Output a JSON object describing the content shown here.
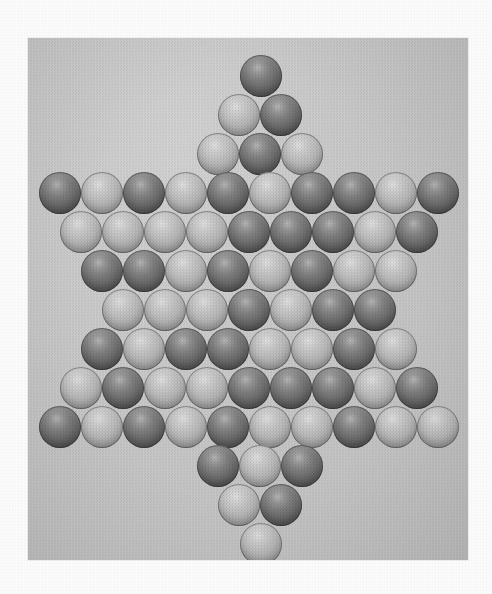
{
  "scene": {
    "title": "Chinese checkers marbles arranged in a six-pointed star",
    "paper_color": "#fbfbfb",
    "photo": {
      "x": 28,
      "y": 38,
      "width": 440,
      "height": 522,
      "background_color": "#c9c9c9",
      "description": "Black and white halftone photograph of a Chinese checkers board completely filled with marbles forming a six-pointed star"
    }
  },
  "legend": {
    "dark_label": "dark marble",
    "light_label": "light marble",
    "dark_color": "#6d6d6d",
    "light_color": "#c3c3c3"
  },
  "board": {
    "marble_diameter": 42,
    "row_pitch": 39,
    "column_pitch": 42,
    "total_marbles": 81,
    "dark_count": 38,
    "light_count": 43,
    "rows": [
      {
        "index": 1,
        "count": 1,
        "x": 212,
        "y": 17,
        "colors": [
          "dark"
        ]
      },
      {
        "index": 2,
        "count": 2,
        "x": 190,
        "y": 56,
        "colors": [
          "light",
          "dark"
        ]
      },
      {
        "index": 3,
        "count": 3,
        "x": 169,
        "y": 95,
        "colors": [
          "light",
          "dark",
          "light"
        ]
      },
      {
        "index": 4,
        "count": 10,
        "x": 11,
        "y": 134,
        "colors": [
          "dark",
          "light",
          "dark",
          "light",
          "dark",
          "light",
          "dark",
          "dark",
          "light",
          "dark"
        ]
      },
      {
        "index": 5,
        "count": 9,
        "x": 32,
        "y": 173,
        "colors": [
          "light",
          "light",
          "light",
          "light",
          "dark",
          "dark",
          "dark",
          "light",
          "dark"
        ]
      },
      {
        "index": 6,
        "count": 8,
        "x": 53,
        "y": 212,
        "colors": [
          "dark",
          "dark",
          "light",
          "dark",
          "light",
          "dark",
          "light",
          "light"
        ]
      },
      {
        "index": 7,
        "count": 7,
        "x": 74,
        "y": 251,
        "colors": [
          "light",
          "light",
          "light",
          "dark",
          "light",
          "dark",
          "dark"
        ]
      },
      {
        "index": 8,
        "count": 8,
        "x": 53,
        "y": 290,
        "colors": [
          "dark",
          "light",
          "dark",
          "dark",
          "light",
          "light",
          "dark",
          "light"
        ]
      },
      {
        "index": 9,
        "count": 9,
        "x": 32,
        "y": 329,
        "colors": [
          "light",
          "dark",
          "light",
          "light",
          "dark",
          "dark",
          "dark",
          "light",
          "dark"
        ]
      },
      {
        "index": 10,
        "count": 10,
        "x": 11,
        "y": 368,
        "colors": [
          "dark",
          "light",
          "dark",
          "light",
          "dark",
          "light",
          "light",
          "dark",
          "light",
          "light"
        ]
      },
      {
        "index": 11,
        "count": 3,
        "x": 169,
        "y": 407,
        "colors": [
          "dark",
          "light",
          "dark"
        ]
      },
      {
        "index": 12,
        "count": 2,
        "x": 190,
        "y": 446,
        "colors": [
          "light",
          "dark"
        ]
      },
      {
        "index": 13,
        "count": 1,
        "x": 212,
        "y": 485,
        "colors": [
          "light"
        ]
      }
    ]
  }
}
